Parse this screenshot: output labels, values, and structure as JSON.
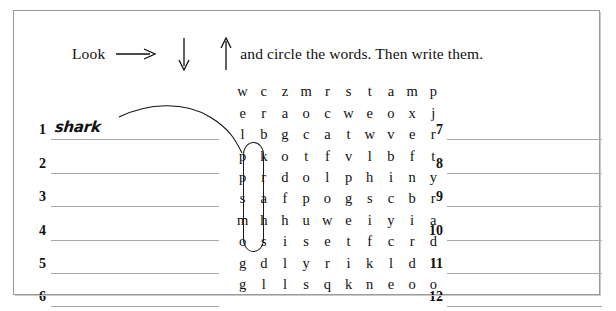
{
  "worksheet": {
    "instruction": {
      "lead": "Look",
      "arrow_right_icon": "arrow-right-icon",
      "arrow_down_icon": "arrow-down-icon",
      "arrow_up_icon": "arrow-up-icon",
      "tail": "and circle the words. Then write them."
    },
    "letter_grid": {
      "rows": 10,
      "columns": 10,
      "letters": [
        [
          "w",
          "c",
          "z",
          "m",
          "r",
          "s",
          "t",
          "a",
          "m",
          "p"
        ],
        [
          "e",
          "r",
          "a",
          "o",
          "c",
          "w",
          "e",
          "o",
          "x",
          "j"
        ],
        [
          "l",
          "b",
          "g",
          "c",
          "a",
          "t",
          "w",
          "v",
          "e",
          "r"
        ],
        [
          "p",
          "k",
          "o",
          "t",
          "f",
          "v",
          "l",
          "b",
          "f",
          "t"
        ],
        [
          "p",
          "r",
          "d",
          "o",
          "l",
          "p",
          "h",
          "i",
          "n",
          "y"
        ],
        [
          "s",
          "a",
          "f",
          "p",
          "o",
          "g",
          "s",
          "c",
          "b",
          "r"
        ],
        [
          "m",
          "h",
          "h",
          "u",
          "w",
          "e",
          "i",
          "y",
          "i",
          "a"
        ],
        [
          "o",
          "s",
          "i",
          "s",
          "e",
          "t",
          "f",
          "c",
          "r",
          "d"
        ],
        [
          "g",
          "d",
          "l",
          "y",
          "r",
          "i",
          "k",
          "l",
          "d",
          "i"
        ],
        [
          "g",
          "l",
          "l",
          "s",
          "q",
          "k",
          "n",
          "e",
          "o",
          "o"
        ]
      ]
    },
    "circled_word": {
      "word": "shark",
      "direction": "up",
      "column": 2,
      "start_row": 8,
      "end_row": 4
    },
    "answers_left": [
      {
        "number": "1",
        "value": "shark"
      },
      {
        "number": "2",
        "value": ""
      },
      {
        "number": "3",
        "value": ""
      },
      {
        "number": "4",
        "value": ""
      },
      {
        "number": "5",
        "value": ""
      },
      {
        "number": "6",
        "value": ""
      }
    ],
    "answers_right": [
      {
        "number": "7",
        "value": ""
      },
      {
        "number": "8",
        "value": ""
      },
      {
        "number": "9",
        "value": ""
      },
      {
        "number": "10",
        "value": ""
      },
      {
        "number": "11",
        "value": ""
      },
      {
        "number": "12",
        "value": ""
      }
    ],
    "colors": {
      "border": "#9a9a9a",
      "rule_line": "#a8a8a8",
      "ink": "#101010"
    }
  }
}
